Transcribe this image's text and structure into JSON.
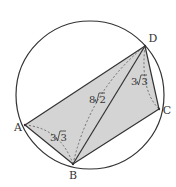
{
  "diagram": {
    "type": "cyclic-quadrilateral",
    "circle": {
      "cx": 90,
      "cy": 95,
      "r": 74
    },
    "colors": {
      "stroke": "#333333",
      "fill": "#d4d4d4",
      "dashed": "#555555",
      "background": "#ffffff"
    },
    "vertices": [
      {
        "name": "A",
        "x": 25,
        "y": 125,
        "label": "A",
        "label_x": 18,
        "label_y": 131
      },
      {
        "name": "B",
        "x": 73,
        "y": 164,
        "label": "B",
        "label_x": 73,
        "label_y": 179
      },
      {
        "name": "C",
        "x": 159,
        "y": 109,
        "label": "C",
        "label_x": 167,
        "label_y": 114
      },
      {
        "name": "D",
        "x": 145,
        "y": 46,
        "label": "D",
        "label_x": 153,
        "label_y": 42
      }
    ],
    "segments": {
      "solid": [
        "AB",
        "BC",
        "CD",
        "DA",
        "BD"
      ],
      "dashed_arcs": [
        "AB",
        "BD",
        "DC"
      ]
    },
    "measures": [
      {
        "segment": "AB",
        "coef": "3",
        "radicand": "3",
        "text": "3√3",
        "x": 57,
        "y": 141
      },
      {
        "segment": "BD",
        "coef": "8",
        "radicand": "2",
        "text": "8√2",
        "x": 97,
        "y": 103
      },
      {
        "segment": "DC",
        "coef": "3",
        "radicand": "3",
        "text": "3√3",
        "x": 139,
        "y": 85
      }
    ]
  }
}
